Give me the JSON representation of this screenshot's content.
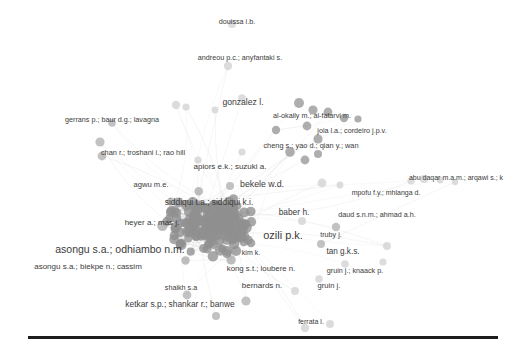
{
  "figure": {
    "type": "co-authorship-network",
    "width": 526,
    "height": 352,
    "background_color": "#ffffff",
    "label_color": "#3b3b3b",
    "node_fill_dark": "#8f8f8f",
    "node_fill_mid": "#ababab",
    "node_fill_light": "#cfcfcf",
    "edge_color": "#c8c8c8",
    "rule_color": "#1d1d1d"
  },
  "baseline_rule": {
    "x": 28,
    "y": 336,
    "width": 470,
    "height": 3
  },
  "chart_data": {
    "type": "scatter",
    "title": "",
    "xlabel": "",
    "ylabel": "",
    "legend": [],
    "labels": [
      {
        "text": "douissa i.b.",
        "x": 237,
        "y": 22,
        "size": 7.2,
        "weight": "normal"
      },
      {
        "text": "andreou p.c.; anyfantaki s.",
        "x": 240,
        "y": 58,
        "size": 7.2,
        "weight": "normal"
      },
      {
        "text": "gonzalez l.",
        "x": 243,
        "y": 102,
        "size": 8.6,
        "weight": "normal"
      },
      {
        "text": "gerrans p.; baur d.g.; lavagna",
        "x": 112,
        "y": 120,
        "size": 7.2,
        "weight": "normal"
      },
      {
        "text": "al-okaily m.; al-fatarvi m.",
        "x": 312,
        "y": 116,
        "size": 7.2,
        "weight": "normal"
      },
      {
        "text": "joia l.a.; cordeiro j.p.v.",
        "x": 352,
        "y": 131,
        "size": 7.2,
        "weight": "normal"
      },
      {
        "text": "chan r.; troshani i.; rao hill",
        "x": 143,
        "y": 153,
        "size": 7.4,
        "weight": "normal"
      },
      {
        "text": "cheng s.; yao d.; qian y.; wan",
        "x": 311,
        "y": 146,
        "size": 7.4,
        "weight": "normal"
      },
      {
        "text": "apiors e.k.; suzuki a.",
        "x": 230,
        "y": 167,
        "size": 8.0,
        "weight": "normal"
      },
      {
        "text": "agwu m.e.",
        "x": 151,
        "y": 185,
        "size": 7.6,
        "weight": "normal"
      },
      {
        "text": "bekele w.d.",
        "x": 262,
        "y": 184,
        "size": 8.8,
        "weight": "normal"
      },
      {
        "text": "abu daqar m.a.m.; arqawi s.; k",
        "x": 456,
        "y": 177,
        "size": 7.0,
        "weight": "normal"
      },
      {
        "text": "siddiqui t.a.; siddiqui k.i.",
        "x": 209,
        "y": 202,
        "size": 8.4,
        "weight": "normal"
      },
      {
        "text": "mpofu f.y.; mhlanga d.",
        "x": 386,
        "y": 192,
        "size": 7.0,
        "weight": "normal"
      },
      {
        "text": "baber h.",
        "x": 294,
        "y": 212,
        "size": 8.4,
        "weight": "normal"
      },
      {
        "text": "daud s.n.m.; ahmad a.h.",
        "x": 377,
        "y": 215,
        "size": 7.2,
        "weight": "normal"
      },
      {
        "text": "heyer a.; mas j.",
        "x": 152,
        "y": 223,
        "size": 8.0,
        "weight": "normal"
      },
      {
        "text": "ozili p.k.",
        "x": 283,
        "y": 235,
        "size": 11.0,
        "weight": "normal"
      },
      {
        "text": "truby j.",
        "x": 331,
        "y": 235,
        "size": 7.2,
        "weight": "normal"
      },
      {
        "text": "asongu s.a.; odhiambo n.m.",
        "x": 120,
        "y": 249,
        "size": 10.5,
        "weight": "normal"
      },
      {
        "text": "kim k.",
        "x": 251,
        "y": 252,
        "size": 7.0,
        "weight": "normal"
      },
      {
        "text": "tan g.k.s.",
        "x": 343,
        "y": 252,
        "size": 8.2,
        "weight": "normal"
      },
      {
        "text": "asongu s.a.; biekpe n.; cassim",
        "x": 88,
        "y": 267,
        "size": 8.0,
        "weight": "normal"
      },
      {
        "text": "kong s.t.; loubere n.",
        "x": 261,
        "y": 269,
        "size": 7.8,
        "weight": "normal"
      },
      {
        "text": "gruin j.; knaack p.",
        "x": 355,
        "y": 271,
        "size": 7.2,
        "weight": "normal"
      },
      {
        "text": "shaikh s.a",
        "x": 181,
        "y": 288,
        "size": 7.2,
        "weight": "normal"
      },
      {
        "text": "bernards n.",
        "x": 262,
        "y": 286,
        "size": 8.0,
        "weight": "normal"
      },
      {
        "text": "gruin j.",
        "x": 329,
        "y": 286,
        "size": 7.6,
        "weight": "normal"
      },
      {
        "text": "ketkar s.p.; shankar r.; banwe",
        "x": 180,
        "y": 304,
        "size": 8.4,
        "weight": "normal"
      },
      {
        "text": "ferrata l.",
        "x": 311,
        "y": 321,
        "size": 7.0,
        "weight": "normal"
      }
    ],
    "anchor_nodes": [
      {
        "x": 232,
        "y": 24,
        "r": 4.0,
        "shade": "light"
      },
      {
        "x": 228,
        "y": 66,
        "r": 4.2,
        "shade": "light"
      },
      {
        "x": 176,
        "y": 105,
        "r": 4.2,
        "shade": "light"
      },
      {
        "x": 186,
        "y": 107,
        "r": 3.6,
        "shade": "light"
      },
      {
        "x": 215,
        "y": 110,
        "r": 3.4,
        "shade": "light"
      },
      {
        "x": 242,
        "y": 98,
        "r": 3.8,
        "shade": "light"
      },
      {
        "x": 100,
        "y": 142,
        "r": 4.6,
        "shade": "mid"
      },
      {
        "x": 112,
        "y": 123,
        "r": 3.8,
        "shade": "mid"
      },
      {
        "x": 299,
        "y": 103,
        "r": 5.0,
        "shade": "dark"
      },
      {
        "x": 313,
        "y": 110,
        "r": 4.6,
        "shade": "dark"
      },
      {
        "x": 328,
        "y": 112,
        "r": 4.4,
        "shade": "dark"
      },
      {
        "x": 344,
        "y": 118,
        "r": 4.2,
        "shade": "dark"
      },
      {
        "x": 358,
        "y": 119,
        "r": 3.6,
        "shade": "dark"
      },
      {
        "x": 276,
        "y": 130,
        "r": 4.2,
        "shade": "dark"
      },
      {
        "x": 307,
        "y": 126,
        "r": 4.4,
        "shade": "dark"
      },
      {
        "x": 318,
        "y": 139,
        "r": 4.6,
        "shade": "dark"
      },
      {
        "x": 290,
        "y": 152,
        "r": 4.8,
        "shade": "dark"
      },
      {
        "x": 305,
        "y": 160,
        "r": 4.4,
        "shade": "dark"
      },
      {
        "x": 318,
        "y": 154,
        "r": 4.0,
        "shade": "dark"
      },
      {
        "x": 102,
        "y": 156,
        "r": 4.4,
        "shade": "mid"
      },
      {
        "x": 242,
        "y": 152,
        "r": 3.6,
        "shade": "light"
      },
      {
        "x": 198,
        "y": 160,
        "r": 3.6,
        "shade": "light"
      },
      {
        "x": 230,
        "y": 186,
        "r": 4.0,
        "shade": "mid"
      },
      {
        "x": 322,
        "y": 183,
        "r": 4.4,
        "shade": "light"
      },
      {
        "x": 340,
        "y": 185,
        "r": 3.4,
        "shade": "light"
      },
      {
        "x": 411,
        "y": 181,
        "r": 3.6,
        "shade": "light"
      },
      {
        "x": 424,
        "y": 179,
        "r": 4.0,
        "shade": "light"
      },
      {
        "x": 440,
        "y": 180,
        "r": 3.4,
        "shade": "light"
      },
      {
        "x": 455,
        "y": 182,
        "r": 3.2,
        "shade": "light"
      },
      {
        "x": 302,
        "y": 221,
        "r": 4.0,
        "shade": "light"
      },
      {
        "x": 336,
        "y": 227,
        "r": 4.2,
        "shade": "mid"
      },
      {
        "x": 321,
        "y": 244,
        "r": 4.0,
        "shade": "mid"
      },
      {
        "x": 387,
        "y": 246,
        "r": 4.0,
        "shade": "light"
      },
      {
        "x": 383,
        "y": 262,
        "r": 3.6,
        "shade": "light"
      },
      {
        "x": 345,
        "y": 264,
        "r": 3.8,
        "shade": "light"
      },
      {
        "x": 319,
        "y": 279,
        "r": 3.8,
        "shade": "light"
      },
      {
        "x": 295,
        "y": 291,
        "r": 4.0,
        "shade": "light"
      },
      {
        "x": 305,
        "y": 328,
        "r": 4.2,
        "shade": "light"
      },
      {
        "x": 330,
        "y": 324,
        "r": 4.0,
        "shade": "light"
      },
      {
        "x": 216,
        "y": 316,
        "r": 4.0,
        "shade": "mid"
      },
      {
        "x": 187,
        "y": 295,
        "r": 4.4,
        "shade": "mid"
      },
      {
        "x": 246,
        "y": 301,
        "r": 4.6,
        "shade": "mid"
      }
    ],
    "core": {
      "center_x": 214,
      "center_y": 225,
      "radius_x": 108,
      "radius_y": 72,
      "node_count": 190,
      "edge_count": 430
    }
  }
}
